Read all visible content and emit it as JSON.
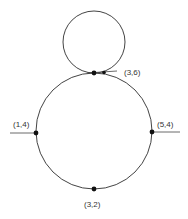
{
  "diagram": {
    "type": "geometry",
    "upper_circle": {
      "cx": 94,
      "cy": 42,
      "r": 31
    },
    "lower_circle": {
      "cx": 94,
      "cy": 131,
      "r": 58
    },
    "points": [
      {
        "id": "p36",
        "label": "(3,6)",
        "x": 94,
        "y": 73
      },
      {
        "id": "p14",
        "label": "(1,4)",
        "x": 36,
        "y": 133
      },
      {
        "id": "p54",
        "label": "(5,4)",
        "x": 152,
        "y": 132
      },
      {
        "id": "p32",
        "label": "(3,2)",
        "x": 94,
        "y": 189
      }
    ],
    "stroke_color": "#444444",
    "point_color": "#111111"
  }
}
